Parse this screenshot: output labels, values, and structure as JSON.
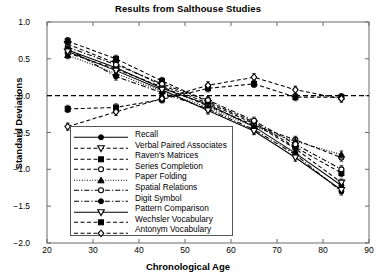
{
  "chart_data": {
    "type": "line",
    "title": "Results from Salthouse Studies",
    "xlabel": "Chronological Age",
    "ylabel": "Standard Deviations",
    "xlim": [
      20,
      90
    ],
    "ylim": [
      -2.0,
      1.0
    ],
    "xticks": [
      20,
      30,
      40,
      50,
      60,
      70,
      80,
      90
    ],
    "yticks": [
      -2.0,
      -1.5,
      -1.0,
      -0.5,
      0.0,
      0.5,
      1.0
    ],
    "xtick_labels": [
      "20",
      "30",
      "40",
      "50",
      "60",
      "70",
      "80",
      "90"
    ],
    "ytick_labels": [
      "-2.0",
      "-1.5",
      "-1.0",
      "-0.5",
      "0.0",
      "0.5",
      "1.0"
    ],
    "grid": false,
    "legend_position": "lower-left",
    "reference_line": {
      "y": 0.0,
      "style": "dashed"
    },
    "error_bars": true,
    "x": [
      24.5,
      35,
      45,
      55,
      65,
      74,
      84
    ],
    "series": [
      {
        "name": "Recall",
        "marker": "filled-circle",
        "line": "solid",
        "values": [
          0.62,
          0.38,
          0.1,
          -0.12,
          -0.42,
          -0.78,
          -1.22
        ]
      },
      {
        "name": "Verbal Paired Associates",
        "marker": "open-down-triangle",
        "line": "dashed",
        "values": [
          0.7,
          0.44,
          0.14,
          -0.1,
          -0.38,
          -0.72,
          -1.18
        ]
      },
      {
        "name": "Raven's Matrices",
        "marker": "filled-square",
        "line": "dashed",
        "values": [
          0.74,
          0.5,
          0.2,
          -0.08,
          -0.36,
          -0.7,
          -1.05
        ]
      },
      {
        "name": "Series Completion",
        "marker": "open-circle",
        "line": "dashed",
        "values": [
          0.58,
          0.36,
          0.12,
          -0.14,
          -0.4,
          -0.6,
          -0.84
        ]
      },
      {
        "name": "Paper Folding",
        "marker": "filled-triangle",
        "line": "dotted",
        "values": [
          0.55,
          0.3,
          0.06,
          -0.16,
          -0.42,
          -0.62,
          -0.8
        ]
      },
      {
        "name": "Spatial Relations",
        "marker": "open-circle",
        "line": "dashdot",
        "values": [
          0.66,
          0.42,
          0.16,
          -0.06,
          -0.34,
          -0.66,
          -1.0
        ]
      },
      {
        "name": "Digit Symbol",
        "marker": "filled-circle",
        "line": "dashdot",
        "values": [
          0.64,
          0.26,
          0.04,
          -0.18,
          -0.46,
          -0.8,
          -1.3
        ]
      },
      {
        "name": "Pattern Comparison",
        "marker": "open-down-triangle",
        "line": "solid",
        "values": [
          0.6,
          0.34,
          0.08,
          -0.2,
          -0.48,
          -0.84,
          -1.28
        ]
      },
      {
        "name": "Wechsler Vocabulary",
        "marker": "filled-square",
        "line": "dashed",
        "values": [
          -0.18,
          -0.16,
          -0.05,
          0.1,
          0.16,
          -0.02,
          -0.02
        ]
      },
      {
        "name": "Antonym Vocabulary",
        "marker": "open-diamond",
        "line": "dashed",
        "values": [
          -0.42,
          -0.22,
          -0.04,
          0.14,
          0.25,
          0.08,
          -0.04
        ]
      }
    ]
  },
  "legend": {
    "items": [
      {
        "label": "Recall"
      },
      {
        "label": "Verbal Paired Associates"
      },
      {
        "label": "Raven's Matrices"
      },
      {
        "label": "Series Completion"
      },
      {
        "label": "Paper Folding"
      },
      {
        "label": "Spatial Relations"
      },
      {
        "label": "Digit Symbol"
      },
      {
        "label": "Pattern Comparison"
      },
      {
        "label": "Wechsler Vocabulary"
      },
      {
        "label": "Antonym Vocabulary"
      }
    ]
  },
  "colors": {
    "ink": "#000000",
    "frame": "#6b6b6b",
    "background": "#ffffff"
  }
}
